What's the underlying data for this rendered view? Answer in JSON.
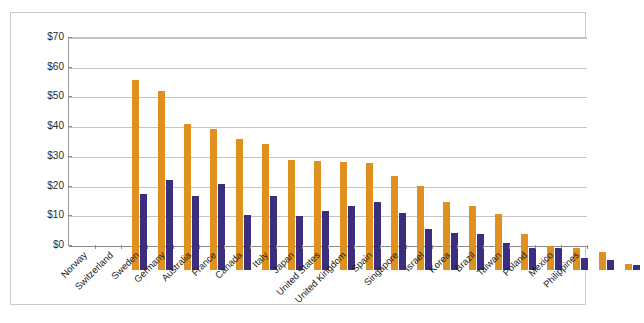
{
  "chart_data": {
    "type": "bar",
    "title": "",
    "subtitle": "",
    "xlabel": "",
    "ylabel": "",
    "ylim": [
      0,
      70
    ],
    "ytick_labels": [
      "$0",
      "$10",
      "$20",
      "$30",
      "$40",
      "$50",
      "$60",
      "$70"
    ],
    "ytick_values": [
      0,
      10,
      20,
      30,
      40,
      50,
      60,
      70
    ],
    "grid": true,
    "legend": "none",
    "orientation": "vertical",
    "grouping": "grouped",
    "categories": [
      "Norway",
      "Switzerland",
      "Sweden",
      "Germany",
      "Australia",
      "France",
      "Canada",
      "Italy",
      "Japan",
      "United States",
      "United Kingdom",
      "Spain",
      "Singapore",
      "Israel",
      "Korea",
      "Brazil",
      "Taiwan",
      "Poland",
      "Mexico",
      "Philippines"
    ],
    "series": [
      {
        "name": "series-1",
        "color": "#e0901e",
        "values": [
          64.0,
          60.3,
          49.0,
          47.3,
          44.0,
          42.3,
          37.0,
          36.8,
          36.3,
          36.0,
          31.5,
          28.4,
          22.8,
          21.5,
          19.0,
          12.2,
          8.0,
          7.3,
          6.0,
          2.0
        ]
      },
      {
        "name": "series-2",
        "color": "#3b2e7e",
        "values": [
          25.6,
          30.3,
          24.8,
          28.8,
          18.5,
          24.8,
          18.2,
          19.8,
          21.7,
          22.9,
          19.2,
          13.8,
          12.3,
          12.2,
          9.2,
          7.3,
          7.5,
          4.0,
          3.5,
          1.6
        ]
      }
    ],
    "colors": {
      "series_1": "#e0901e",
      "series_2": "#3b2e7e",
      "gridline": "#c4c4c4",
      "axis": "#8a8a8a",
      "frame": "#c9c9c9",
      "background": "#ffffff",
      "text": "#1d1d1d"
    }
  }
}
